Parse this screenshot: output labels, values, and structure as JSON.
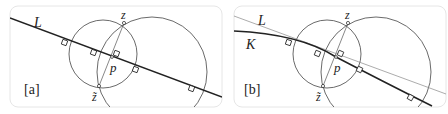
{
  "panels": [
    {
      "id": "a",
      "tag": "[a]",
      "labels": {
        "line": "L",
        "top_point": "z",
        "bottom_point": "z̃",
        "center_point": "p"
      }
    },
    {
      "id": "b",
      "tag": "[b]",
      "labels": {
        "line": "L",
        "curve": "K",
        "top_point": "z",
        "bottom_point": "z̃",
        "center_point": "p"
      }
    }
  ],
  "colors": {
    "stroke": "#333333",
    "thin_stroke": "#888888",
    "frame": "#e6e6e6",
    "text": "#222222"
  }
}
